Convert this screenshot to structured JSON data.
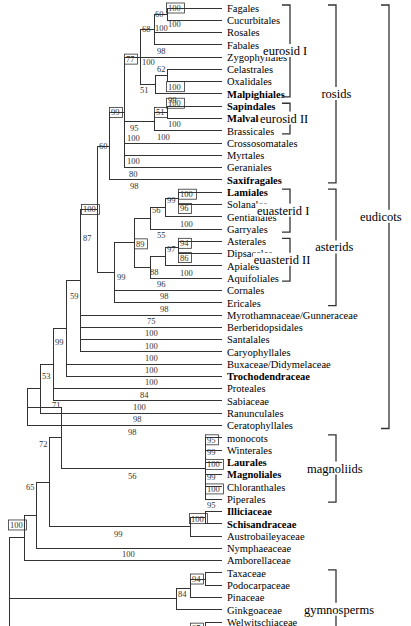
{
  "figure": {
    "type": "phylogenetic-tree",
    "leaves": [
      {
        "name": "Fagales",
        "bold": false
      },
      {
        "name": "Cucurbitales",
        "bold": false
      },
      {
        "name": "Rosales",
        "bold": false
      },
      {
        "name": "Fabales",
        "bold": false
      },
      {
        "name": "Zygophyllales",
        "bold": false
      },
      {
        "name": "Celastrales",
        "bold": false
      },
      {
        "name": "Oxalidales",
        "bold": false
      },
      {
        "name": "Malpighiales",
        "bold": true
      },
      {
        "name": "Sapindales",
        "bold": true
      },
      {
        "name": "Malvales",
        "bold": true
      },
      {
        "name": "Brassicales",
        "bold": false
      },
      {
        "name": "Crossosomatales",
        "bold": false
      },
      {
        "name": "Myrtales",
        "bold": false
      },
      {
        "name": "Geraniales",
        "bold": false
      },
      {
        "name": "Saxifragales",
        "bold": true
      },
      {
        "name": "Lamiales",
        "bold": true
      },
      {
        "name": "Solanales",
        "bold": false
      },
      {
        "name": "Gentianales",
        "bold": false
      },
      {
        "name": "Garryales",
        "bold": false
      },
      {
        "name": "Asterales",
        "bold": false
      },
      {
        "name": "Dipsacales",
        "bold": false
      },
      {
        "name": "Apiales",
        "bold": false
      },
      {
        "name": "Aquifoliales",
        "bold": false
      },
      {
        "name": "Cornales",
        "bold": false
      },
      {
        "name": "Ericales",
        "bold": false
      },
      {
        "name": "Myrothamnaceae/Gunneraceae",
        "bold": false
      },
      {
        "name": "Berberidopsidales",
        "bold": false
      },
      {
        "name": "Santalales",
        "bold": false
      },
      {
        "name": "Caryophyllales",
        "bold": false
      },
      {
        "name": "Buxaceae/Didymelaceae",
        "bold": false
      },
      {
        "name": "Trochodendraceae",
        "bold": true
      },
      {
        "name": "Proteales",
        "bold": false
      },
      {
        "name": "Sabiaceae",
        "bold": false
      },
      {
        "name": "Ranunculales",
        "bold": false
      },
      {
        "name": "Ceratophyllales",
        "bold": false
      },
      {
        "name": "monocots",
        "bold": false
      },
      {
        "name": "Winterales",
        "bold": false
      },
      {
        "name": "Laurales",
        "bold": true
      },
      {
        "name": "Magnoliales",
        "bold": true
      },
      {
        "name": "Chloranthales",
        "bold": false
      },
      {
        "name": "Piperales",
        "bold": false
      },
      {
        "name": "Illiciaceae",
        "bold": true
      },
      {
        "name": "Schisandraceae",
        "bold": true
      },
      {
        "name": "Austrobaileyaceae",
        "bold": false
      },
      {
        "name": "Nymphaeaceae",
        "bold": false
      },
      {
        "name": "Amborellaceae",
        "bold": false
      },
      {
        "name": "Taxaceae",
        "bold": false
      },
      {
        "name": "Podocarpaceae",
        "bold": false
      },
      {
        "name": "Pinaceae",
        "bold": false
      },
      {
        "name": "Ginkgoaceae",
        "bold": false
      },
      {
        "name": "Welwitschiaceae",
        "bold": false
      },
      {
        "name": "Gnetaceae",
        "bold": false
      },
      {
        "name": "Ephedraceae",
        "bold": false
      }
    ],
    "groups": [
      {
        "label": "eurosid I",
        "from": "Fagales",
        "to": "Malpighiales"
      },
      {
        "label": "eurosid II",
        "from": "Sapindales",
        "to": "Brassicales"
      },
      {
        "label": "rosids",
        "from": "Fagales",
        "to": "Saxifragales"
      },
      {
        "label": "euasterid I",
        "from": "Lamiales",
        "to": "Garryales"
      },
      {
        "label": "euasterid II",
        "from": "Asterales",
        "to": "Aquifoliales"
      },
      {
        "label": "asterids",
        "from": "Lamiales",
        "to": "Ericales"
      },
      {
        "label": "eudicots",
        "from": "Fagales",
        "to": "Ceratophyllales"
      },
      {
        "label": "magnoliids",
        "from": "monocots",
        "to": "Piperales"
      },
      {
        "label": "gymnosperms",
        "from": "Taxaceae",
        "to": "Ephedraceae"
      }
    ],
    "support_values": {
      "fagales_cucurbitales": 100,
      "fagales_cucurbitales_branch": 60,
      "cucurbitales": 100,
      "rosales": 100,
      "fabales": 98,
      "fagales_fabales": 68,
      "eurosid1": 77,
      "zygophyllales": 100,
      "celastrales_oxalidales": 62,
      "malpighiales_clade": 51,
      "oxalidales": 100,
      "malpighiales": 99,
      "sapindales": 100,
      "sapindales_malvales": 51,
      "malvales": 100,
      "eurosid2": 95,
      "brassicales": 100,
      "rosids_core": 99,
      "crossosomatales": 100,
      "myrtales": 100,
      "geraniales": 80,
      "rosids": 60,
      "saxifragales": 98,
      "lamiales": 100,
      "solanales_gentianales": 99,
      "gentianales": 96,
      "euasterid1": 56,
      "garryales_branch": 100,
      "garryales": 55,
      "asterales": 94,
      "dipsacales_apiales": 97,
      "apiales": 86,
      "euasterid2": 88,
      "aquifoliales": 100,
      "aquifoliales_branch": 96,
      "euasterids": 89,
      "asterids": 99,
      "cornales": 98,
      "ericales": 98,
      "core_eudicots": 100,
      "myrothamnaceae": 75,
      "berberidopsidales": 100,
      "santalales": 100,
      "caryophyllales": 100,
      "gunnerid": 87,
      "buxaceae": 100,
      "trochodendraceae": 100,
      "node59": 59,
      "proteales": 84,
      "sabiaceae": 100,
      "node99": 99,
      "ranunculales": 98,
      "node53": 53,
      "ceratophyllales": 98,
      "node71": 71,
      "monocots": 95,
      "winterales": 99,
      "laurales": 100,
      "magnoliales": 99,
      "chloranthales": 100,
      "piperales": 95,
      "magnoliid_branch": 56,
      "node72": 72,
      "illicium_schisandra": 100,
      "austrobaileyales_branch": 99,
      "node65": 65,
      "nymphaeaceae": 100,
      "root": 100,
      "taxaceae_podocarpaceae": 94,
      "conifers": 84,
      "gnetales": 97,
      "gymnosperms": 100
    }
  }
}
